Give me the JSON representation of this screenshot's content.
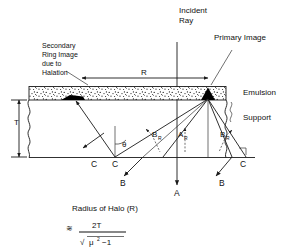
{
  "figure": {
    "title_labels": {
      "incident_ray_line1": "Incident",
      "incident_ray_line2": "Ray",
      "primary_image": "Primary Image",
      "secondary_line1": "Secondary",
      "secondary_line2": "Ring Image",
      "secondary_line3": "due to",
      "secondary_line4": "Halation",
      "emulsion": "Emulsion",
      "support": "Support"
    },
    "dimensions": {
      "radius_symbol": "R",
      "thickness_symbol": "T"
    },
    "ray_labels": {
      "theta": "θ",
      "a_main": "A",
      "a_sub": "R",
      "b_left_main": "B",
      "b_left_sub": "R",
      "b_right_main": "B",
      "b_right_sub": "R",
      "c_far_left": "C",
      "c_left": "C",
      "c_right": "C",
      "b_bottom_left": "B",
      "b_bottom_right": "B",
      "a_bottom": "A"
    },
    "formula": {
      "caption": "Radius of Halo (R)",
      "approx_symbol": "≋",
      "numerator": "2T",
      "radical": "√",
      "denom_mu": "μ",
      "denom_exp": "2",
      "denom_tail": "−1"
    },
    "colors": {
      "ink": "#111111",
      "line": "#1a1a1a",
      "paper": "#ffffff",
      "emulsion_fill": "#f2f2f2",
      "image_blob": "#000000"
    }
  }
}
